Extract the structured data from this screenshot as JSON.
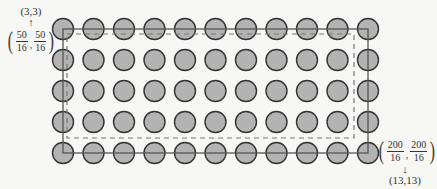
{
  "chart_data": {
    "type": "diagram",
    "grid": {
      "columns": 11,
      "rows": 5,
      "circle_fill": "#b3b3b3",
      "circle_stroke": "#333333"
    },
    "rectangles": [
      {
        "style": "solid",
        "from": "(3,3)",
        "to": "(13,13)"
      },
      {
        "style": "dashed",
        "note": "inner region inset from solid rectangle"
      }
    ],
    "annotations": [
      {
        "position": "top-left",
        "point": "(3,3)",
        "fraction": "50/16, 50/16"
      },
      {
        "position": "bottom-right",
        "point": "(13,13)",
        "fraction": "200/16, 200/16"
      }
    ]
  },
  "top_left_label": {
    "point": "(3,3)",
    "arrow": "↑",
    "num1": "50",
    "den1": "16",
    "num2": "50",
    "den2": "16",
    "sep": ","
  },
  "bottom_right_label": {
    "point": "(13,13)",
    "arrow": "↓",
    "num1": "200",
    "den1": "16",
    "num2": "200",
    "den2": "16",
    "sep": ","
  },
  "colors": {
    "circle_fill": "#b3b3b3",
    "circle_stroke": "#333333",
    "solid_line": "#555555",
    "dashed_line": "#777777"
  }
}
